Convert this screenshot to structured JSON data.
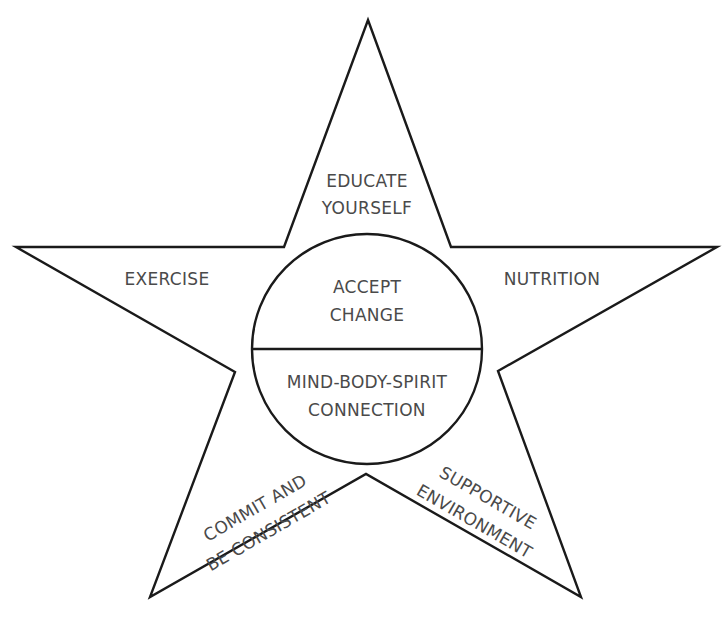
{
  "diagram": {
    "type": "star",
    "colors": {
      "stroke": "#1a1a1a",
      "text": "#4a4a4a",
      "background": "#ffffff"
    },
    "points": {
      "top": "EDUCATE YOURSELF",
      "left": "EXERCISE",
      "right": "NUTRITION",
      "bottom_left": "COMMIT AND BE CONSISTENT",
      "bottom_right": "SUPPORTIVE ENVIRONMENT"
    },
    "labels": {
      "top_line1": "EDUCATE",
      "top_line2": "YOURSELF",
      "left": "EXERCISE",
      "right": "NUTRITION",
      "bottom_left_line1": "COMMIT AND",
      "bottom_left_line2": "BE CONSISTENT",
      "bottom_right_line1": "SUPPORTIVE",
      "bottom_right_line2": "ENVIRONMENT"
    },
    "center_circle": {
      "upper_line1": "ACCEPT",
      "upper_line2": "CHANGE",
      "lower_line1": "MIND-BODY-SPIRIT",
      "lower_line2": "CONNECTION"
    }
  }
}
